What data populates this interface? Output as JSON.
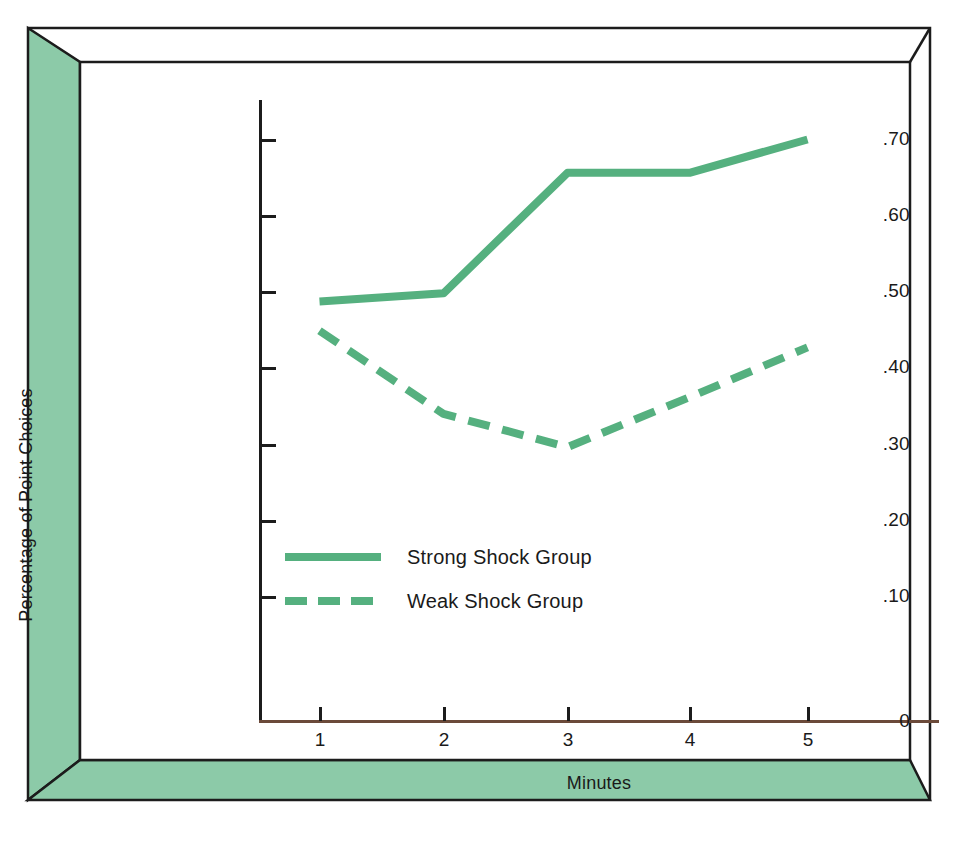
{
  "figure": {
    "background_color": "#ffffff",
    "frame_color": "#8ccaa8",
    "accent_color": "#55b07f",
    "axis_color": "#1c1c1c"
  },
  "chart_data": {
    "type": "line",
    "title": "",
    "xlabel": "Minutes",
    "ylabel": "Percentage of Point Choices",
    "categories": [
      1,
      2,
      3,
      4,
      5
    ],
    "x": [
      1,
      2,
      3,
      4,
      5
    ],
    "xtick_labels": [
      "1",
      "2",
      "3",
      "4",
      "5"
    ],
    "ytick_labels": [
      "0",
      ".10",
      ".20",
      ".30",
      ".40",
      ".50",
      ".60",
      ".70"
    ],
    "ytick_values": [
      0,
      0.1,
      0.2,
      0.3,
      0.4,
      0.5,
      0.6,
      0.7
    ],
    "ylim": [
      0,
      0.735
    ],
    "xlim": [
      0.5,
      5.4
    ],
    "grid": false,
    "legend_position": "center-left",
    "series": [
      {
        "name": "Strong Shock Group",
        "style": "solid",
        "color": "#55b07f",
        "values": [
          0.505,
          0.515,
          0.66,
          0.66,
          0.7
        ]
      },
      {
        "name": "Weak Shock Group",
        "style": "dashed",
        "color": "#55b07f",
        "values": [
          0.47,
          0.37,
          0.33,
          0.39,
          0.45
        ]
      }
    ]
  },
  "legend": {
    "items": [
      {
        "label": "Strong Shock Group",
        "style": "solid"
      },
      {
        "label": "Weak Shock Group",
        "style": "dashed"
      }
    ]
  }
}
